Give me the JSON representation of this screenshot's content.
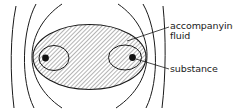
{
  "diagram": {
    "type": "schematic",
    "labels": {
      "accompanying_fluid_line1": "accompanying",
      "accompanying_fluid_line2": "fluid",
      "substance": "substance"
    },
    "elements": {
      "outer_body": "hatched ellipse of accompanying fluid",
      "inner_regions": 2,
      "substance_dots": 2,
      "flow_lines_left": 3,
      "flow_lines_right": 3
    },
    "colors": {
      "stroke": "#1a1a1a",
      "hatch": "#555555",
      "background": "#ffffff"
    }
  }
}
